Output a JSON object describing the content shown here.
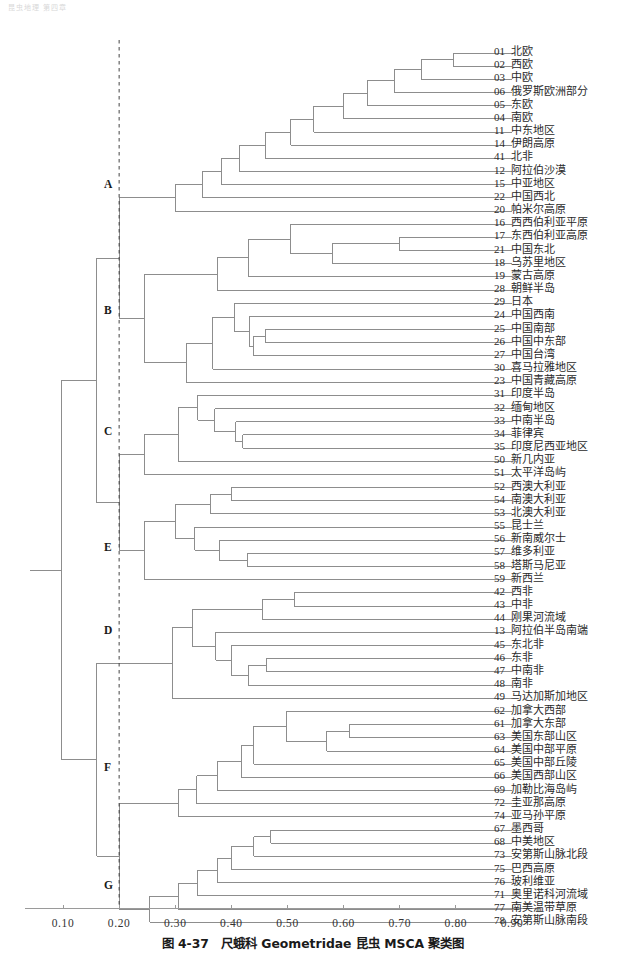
{
  "page_header": "昆虫地理  第四章",
  "caption": "图 4-37　尺蛾科 Geometridae 昆虫 MSCA 聚类图",
  "axis": {
    "ticks": [
      "0.10",
      "0.20",
      "0.30",
      "0.40",
      "0.50",
      "0.60",
      "0.70",
      "0.80",
      "0.90"
    ],
    "tick_values": [
      0.1,
      0.2,
      0.3,
      0.4,
      0.5,
      0.6,
      0.7,
      0.8,
      0.9
    ],
    "threshold_line": "0.20"
  },
  "groups": [
    {
      "id": "A",
      "label": "A",
      "y": 185
    },
    {
      "id": "B",
      "label": "B",
      "y": 311
    },
    {
      "id": "C",
      "label": "C",
      "y": 432
    },
    {
      "id": "E",
      "label": "E",
      "y": 548
    },
    {
      "id": "D",
      "label": "D",
      "y": 631
    },
    {
      "id": "F",
      "label": "F",
      "y": 768
    },
    {
      "id": "G",
      "label": "G",
      "y": 886
    }
  ],
  "chart_data": {
    "type": "dendrogram",
    "title": "图 4-37　尺蛾科 Geometridae 昆虫 MSCA 聚类图",
    "xlabel": "",
    "ylabel": "",
    "xlim": [
      0.035,
      0.92
    ],
    "grid": false,
    "orientation": "horizontal-left-root",
    "threshold": 0.2,
    "leaves": [
      {
        "code": "01",
        "name": "北欧",
        "group": "A"
      },
      {
        "code": "02",
        "name": "西欧",
        "group": "A"
      },
      {
        "code": "03",
        "name": "中欧",
        "group": "A"
      },
      {
        "code": "06",
        "name": "俄罗斯欧洲部分",
        "group": "A"
      },
      {
        "code": "05",
        "name": "东欧",
        "group": "A"
      },
      {
        "code": "04",
        "name": "南欧",
        "group": "A"
      },
      {
        "code": "11",
        "name": "中东地区",
        "group": "A"
      },
      {
        "code": "14",
        "name": "伊朗高原",
        "group": "A"
      },
      {
        "code": "41",
        "name": "北非",
        "group": "A"
      },
      {
        "code": "12",
        "name": "阿拉伯沙漠",
        "group": "A"
      },
      {
        "code": "15",
        "name": "中亚地区",
        "group": "A"
      },
      {
        "code": "22",
        "name": "中国西北",
        "group": "A"
      },
      {
        "code": "20",
        "name": "帕米尔高原",
        "group": "A"
      },
      {
        "code": "16",
        "name": "西西伯利亚平原",
        "group": "B"
      },
      {
        "code": "17",
        "name": "东西伯利亚高原",
        "group": "B"
      },
      {
        "code": "21",
        "name": "中国东北",
        "group": "B"
      },
      {
        "code": "18",
        "name": "乌苏里地区",
        "group": "B"
      },
      {
        "code": "19",
        "name": "蒙古高原",
        "group": "B"
      },
      {
        "code": "28",
        "name": "朝鲜半岛",
        "group": "B"
      },
      {
        "code": "29",
        "name": "日本",
        "group": "B"
      },
      {
        "code": "24",
        "name": "中国西南",
        "group": "B"
      },
      {
        "code": "25",
        "name": "中国南部",
        "group": "B"
      },
      {
        "code": "26",
        "name": "中国中东部",
        "group": "B"
      },
      {
        "code": "27",
        "name": "中国台湾",
        "group": "B"
      },
      {
        "code": "30",
        "name": "喜马拉雅地区",
        "group": "B"
      },
      {
        "code": "23",
        "name": "中国青藏高原",
        "group": "B"
      },
      {
        "code": "31",
        "name": "印度半岛",
        "group": "C"
      },
      {
        "code": "32",
        "name": "缅甸地区",
        "group": "C"
      },
      {
        "code": "33",
        "name": "中南半岛",
        "group": "C"
      },
      {
        "code": "34",
        "name": "菲律宾",
        "group": "C"
      },
      {
        "code": "35",
        "name": "印度尼西亚地区",
        "group": "C"
      },
      {
        "code": "50",
        "name": "新几内亚",
        "group": "C"
      },
      {
        "code": "51",
        "name": "太平洋岛屿",
        "group": "C"
      },
      {
        "code": "52",
        "name": "西澳大利亚",
        "group": "E"
      },
      {
        "code": "54",
        "name": "南澳大利亚",
        "group": "E"
      },
      {
        "code": "53",
        "name": "北澳大利亚",
        "group": "E"
      },
      {
        "code": "55",
        "name": "昆士兰",
        "group": "E"
      },
      {
        "code": "56",
        "name": "新南威尔士",
        "group": "E"
      },
      {
        "code": "57",
        "name": "维多利亚",
        "group": "E"
      },
      {
        "code": "58",
        "name": "塔斯马尼亚",
        "group": "E"
      },
      {
        "code": "59",
        "name": "新西兰",
        "group": "E"
      },
      {
        "code": "42",
        "name": "西非",
        "group": "D"
      },
      {
        "code": "43",
        "name": "中非",
        "group": "D"
      },
      {
        "code": "44",
        "name": "刚果河流域",
        "group": "D"
      },
      {
        "code": "13",
        "name": "阿拉伯半岛南端",
        "group": "D"
      },
      {
        "code": "45",
        "name": "东北非",
        "group": "D"
      },
      {
        "code": "46",
        "name": "东非",
        "group": "D"
      },
      {
        "code": "47",
        "name": "中南非",
        "group": "D"
      },
      {
        "code": "48",
        "name": "南非",
        "group": "D"
      },
      {
        "code": "49",
        "name": "马达加斯加地区",
        "group": "D"
      },
      {
        "code": "62",
        "name": "加拿大西部",
        "group": "F"
      },
      {
        "code": "61",
        "name": "加拿大东部",
        "group": "F"
      },
      {
        "code": "63",
        "name": "美国东部山区",
        "group": "F"
      },
      {
        "code": "64",
        "name": "美国中部平原",
        "group": "F"
      },
      {
        "code": "65",
        "name": "美国中部丘陵",
        "group": "F"
      },
      {
        "code": "66",
        "name": "美国西部山区",
        "group": "F"
      },
      {
        "code": "69",
        "name": "加勒比海岛屿",
        "group": "F"
      },
      {
        "code": "72",
        "name": "圭亚那高原",
        "group": "F"
      },
      {
        "code": "74",
        "name": "亚马孙平原",
        "group": "F"
      },
      {
        "code": "67",
        "name": "墨西哥",
        "group": "G"
      },
      {
        "code": "68",
        "name": "中美地区",
        "group": "G"
      },
      {
        "code": "73",
        "name": "安第斯山脉北段",
        "group": "G"
      },
      {
        "code": "75",
        "name": "巴西高原",
        "group": "G"
      },
      {
        "code": "76",
        "name": "玻利维亚",
        "group": "G"
      },
      {
        "code": "71",
        "name": "奥里诺科河流域",
        "group": "G"
      },
      {
        "code": "77",
        "name": "南美温带草原",
        "group": "G"
      },
      {
        "code": "78",
        "name": "安第斯山脉南段",
        "group": "G"
      }
    ],
    "merges": [
      {
        "x": 0.795,
        "children": [
          "01",
          "02"
        ]
      },
      {
        "x": 0.738,
        "children": [
          "01-02",
          "03"
        ]
      },
      {
        "x": 0.69,
        "children": [
          "01-03",
          "06"
        ]
      },
      {
        "x": 0.642,
        "children": [
          "01-06",
          "05"
        ]
      },
      {
        "x": 0.6,
        "children": [
          "01-05",
          "04"
        ]
      },
      {
        "x": 0.547,
        "children": [
          "01-04",
          "11"
        ]
      },
      {
        "x": 0.506,
        "children": [
          "01-11",
          "14"
        ]
      },
      {
        "x": 0.46,
        "children": [
          "01-14",
          "41"
        ]
      },
      {
        "x": 0.415,
        "children": [
          "01-41",
          "12"
        ]
      },
      {
        "x": 0.382,
        "children": [
          "01-12",
          "15"
        ]
      },
      {
        "x": 0.348,
        "children": [
          "01-15",
          "22"
        ]
      },
      {
        "x": 0.3,
        "children": [
          "01-22",
          "20"
        ]
      },
      {
        "x": 0.7,
        "children": [
          "17",
          "21"
        ]
      },
      {
        "x": 0.58,
        "children": [
          "17-21",
          "18"
        ]
      },
      {
        "x": 0.505,
        "children": [
          "16",
          "17-18"
        ]
      },
      {
        "x": 0.43,
        "children": [
          "16-18",
          "19"
        ]
      },
      {
        "x": 0.375,
        "children": [
          "16-19",
          "28"
        ]
      },
      {
        "x": 0.46,
        "children": [
          "25",
          "26"
        ]
      },
      {
        "x": 0.435,
        "children": [
          "24",
          "25-26"
        ]
      },
      {
        "x": 0.44,
        "children": [
          "25-26",
          "27"
        ]
      },
      {
        "x": 0.405,
        "children": [
          "29",
          "24-27"
        ]
      },
      {
        "x": 0.367,
        "children": [
          "29-27",
          "30"
        ]
      },
      {
        "x": 0.32,
        "children": [
          "29-30",
          "23"
        ]
      },
      {
        "x": 0.245,
        "children": [
          "16-28",
          "29-23"
        ]
      },
      {
        "x": 0.42,
        "children": [
          "34",
          "35"
        ]
      },
      {
        "x": 0.408,
        "children": [
          "33",
          "34-35"
        ]
      },
      {
        "x": 0.37,
        "children": [
          "32",
          "33-35"
        ]
      },
      {
        "x": 0.34,
        "children": [
          "31",
          "32-35"
        ]
      },
      {
        "x": 0.305,
        "children": [
          "31-35",
          "50"
        ]
      },
      {
        "x": 0.245,
        "children": [
          "31-50",
          "51"
        ]
      },
      {
        "x": 0.4,
        "children": [
          "52",
          "54"
        ]
      },
      {
        "x": 0.362,
        "children": [
          "52-54",
          "53"
        ]
      },
      {
        "x": 0.428,
        "children": [
          "57",
          "58"
        ]
      },
      {
        "x": 0.378,
        "children": [
          "56",
          "57-58"
        ]
      },
      {
        "x": 0.335,
        "children": [
          "55",
          "56-58"
        ]
      },
      {
        "x": 0.3,
        "children": [
          "52-53",
          "55-58"
        ]
      },
      {
        "x": 0.245,
        "children": [
          "52-58",
          "59"
        ]
      },
      {
        "x": 0.2,
        "children": [
          "31-51",
          "52-59"
        ]
      },
      {
        "x": 0.512,
        "children": [
          "42",
          "43"
        ]
      },
      {
        "x": 0.455,
        "children": [
          "42-43",
          "44"
        ]
      },
      {
        "x": 0.462,
        "children": [
          "46",
          "47"
        ]
      },
      {
        "x": 0.43,
        "children": [
          "46-47",
          "48"
        ]
      },
      {
        "x": 0.4,
        "children": [
          "45",
          "46-48"
        ]
      },
      {
        "x": 0.372,
        "children": [
          "13",
          "45-48"
        ]
      },
      {
        "x": 0.33,
        "children": [
          "42-44",
          "13-48"
        ]
      },
      {
        "x": 0.295,
        "children": [
          "42-48",
          "49"
        ]
      },
      {
        "x": 0.61,
        "children": [
          "61",
          "63"
        ]
      },
      {
        "x": 0.57,
        "children": [
          "61-63",
          "64"
        ]
      },
      {
        "x": 0.498,
        "children": [
          "62",
          "61-64"
        ]
      },
      {
        "x": 0.44,
        "children": [
          "62-64",
          "65"
        ]
      },
      {
        "x": 0.418,
        "children": [
          "62-65",
          "66"
        ]
      },
      {
        "x": 0.375,
        "children": [
          "62-66",
          "69"
        ]
      },
      {
        "x": 0.338,
        "children": [
          "62-69",
          "72"
        ]
      },
      {
        "x": 0.305,
        "children": [
          "62-72",
          "74"
        ]
      },
      {
        "x": 0.47,
        "children": [
          "67",
          "68"
        ]
      },
      {
        "x": 0.44,
        "children": [
          "67-68",
          "73"
        ]
      },
      {
        "x": 0.4,
        "children": [
          "67-73",
          "75"
        ]
      },
      {
        "x": 0.375,
        "children": [
          "67-75",
          "76"
        ]
      },
      {
        "x": 0.34,
        "children": [
          "67-76",
          "71"
        ]
      },
      {
        "x": 0.305,
        "children": [
          "67-71",
          "77"
        ]
      },
      {
        "x": 0.255,
        "children": [
          "67-77",
          "78"
        ]
      },
      {
        "x": 0.2,
        "children": [
          "62-74",
          "67-78"
        ]
      },
      {
        "x": 0.2,
        "children": [
          "A",
          "B"
        ]
      },
      {
        "x": 0.16,
        "children": [
          "A-B",
          "C-E"
        ]
      },
      {
        "x": 0.16,
        "children": [
          "D",
          "F-G"
        ]
      },
      {
        "x": 0.098,
        "children": [
          "A-E",
          "D-G"
        ]
      },
      {
        "x": 0.06,
        "children": [
          "root"
        ]
      }
    ]
  }
}
